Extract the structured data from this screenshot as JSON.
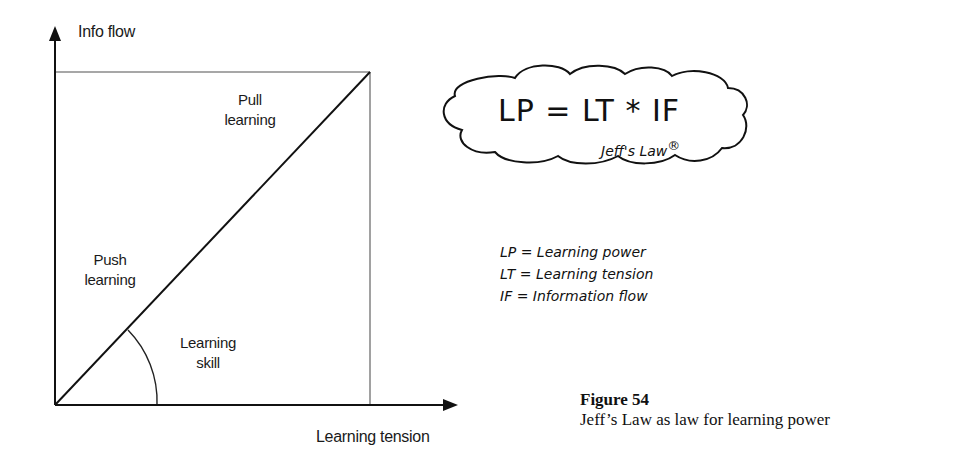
{
  "diagram": {
    "axes": {
      "y_label": "Info flow",
      "x_label": "Learning tension"
    },
    "regions": {
      "pull": [
        "Pull",
        "learning"
      ],
      "push": [
        "Push",
        "learning"
      ],
      "angle": [
        "Learning",
        "skill"
      ]
    },
    "cloud": {
      "formula": "LP = LT * IF",
      "signature": "Jeff's Law",
      "mark": "®"
    },
    "legend": [
      "LP = Learning power",
      "LT = Learning tension",
      "IF = Information flow"
    ],
    "caption": {
      "title": "Figure 54",
      "text": "Jeff’s Law as law for learning power"
    },
    "colors": {
      "axis": "#111111",
      "box": "#8a8a8a",
      "diagonal": "#111111"
    }
  }
}
